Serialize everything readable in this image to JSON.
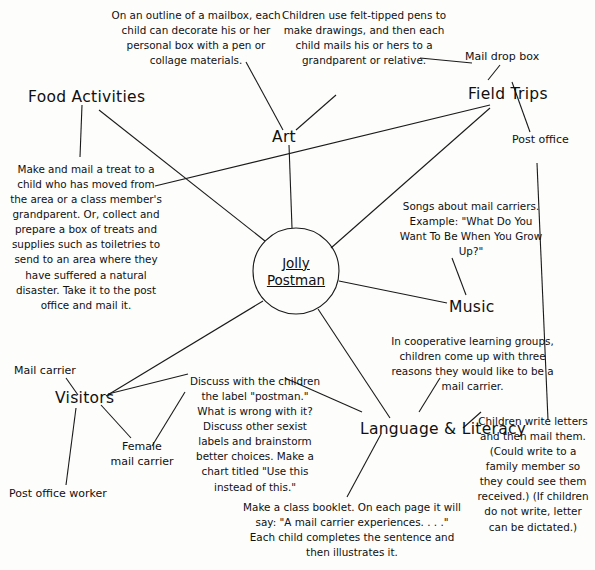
{
  "diagram": {
    "title_center_line1": "Jolly",
    "title_center_line2": "Postman",
    "topics": {
      "food_activities": "Food Activities",
      "art": "Art",
      "field_trips": "Field Trips",
      "music": "Music",
      "language_literacy": "Language & Literacy",
      "visitors": "Visitors"
    },
    "subnodes": {
      "mail_drop_box": "Mail drop box",
      "post_office": "Post office",
      "mail_carrier": "Mail carrier",
      "female_mail_carrier_line1": "Female",
      "female_mail_carrier_line2": "mail carrier",
      "post_office_worker": "Post office worker"
    },
    "notes": {
      "art_mailbox": "On an outline of a mailbox, each child can decorate his or her personal box with a pen or collage materials.",
      "art_felt_tipped": "Children use felt-tipped pens to make drawings, and then each child mails his or hers to a grandparent or relative.",
      "food_treat": "Make and mail a treat to a child who has moved from the area or a class member's grandparent. Or, collect and prepare a box of treats and supplies such as toiletries to send to an area where they have suffered a natural disaster. Take it to the post office and mail it.",
      "music_songs": "Songs about mail carriers. Example: \"What Do You Want To Be When You Grow Up?\"",
      "cooperative_groups": "In cooperative learning groups, children come up with three reasons they would like to be a mail carrier.",
      "write_letters": "Children write letters and then mail them. (Could write to a family member so they could see them received.) (If children do not write,  letter can be dictated.)",
      "postman_label": "Discuss with the children the label \"postman.\" What is wrong with it? Discuss other sexist labels and brainstorm better choices. Make a chart titled \"Use this instead of this.\"",
      "class_booklet": "Make a class booklet. On each page it will say: \"A mail carrier experiences. . . .\" Each child completes the sentence and then illustrates it."
    },
    "colors": {
      "ink": "#1a1a1a",
      "paper": "#fdfdfc"
    }
  }
}
